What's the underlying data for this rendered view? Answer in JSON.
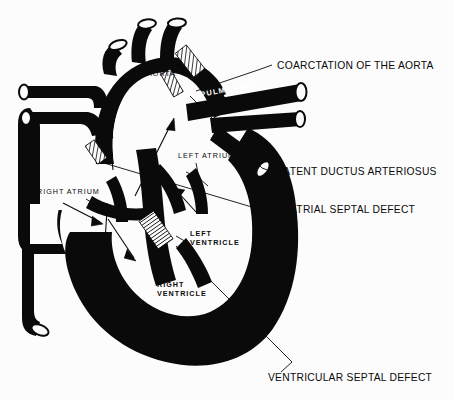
{
  "figure": {
    "background_color": "#fcfcfc",
    "ink_color": "#0a0a0a",
    "lumen_color": "#fcfcfc"
  },
  "callouts": [
    {
      "id": "coarctation",
      "label": "COARCTATION OF THE AORTA",
      "text_x": 277,
      "text_y": 69,
      "leader": "M 272 65 L 258 70 L 196 91",
      "marker": "coarctation-hatch"
    },
    {
      "id": "pda",
      "label": "PATENT DUCTUS ARTERIOSUS",
      "text_x": 277,
      "text_y": 175,
      "leader": "M 273 172 L 262 168 L 190 96",
      "marker": "pda-hatch"
    },
    {
      "id": "asd",
      "label": "ATRIAL SEPTAL DEFECT",
      "text_x": 290,
      "text_y": 213,
      "leader": "M 286 209 L 272 213 L 104 163",
      "marker": "asd-hatch"
    },
    {
      "id": "vsd",
      "label": "VENTRICULAR SEPTAL DEFECT",
      "text_x": 268,
      "text_y": 381,
      "leader": "M 281 372 L 292 362 L 176 246",
      "marker": "vsd-hatch"
    }
  ],
  "anatomy_labels": [
    {
      "id": "aorta",
      "label": "AORTA",
      "x": 147,
      "y": 76,
      "color": "#0a0a0a",
      "style": "plain"
    },
    {
      "id": "pulmonary",
      "label": "PULMONARY ARTERY",
      "x": 201,
      "y": 97,
      "color": "#ffffff",
      "style": "vessel",
      "rotation": -11
    },
    {
      "id": "left-atrium",
      "label": "LEFT ATRIUM",
      "x": 178,
      "y": 158,
      "color": "#0a0a0a",
      "style": "plain"
    },
    {
      "id": "right-atrium",
      "label": "RIGHT ATRIUM",
      "x": 37,
      "y": 194,
      "color": "#0a0a0a",
      "style": "plain"
    },
    {
      "id": "left-ventricle-l1",
      "label": "LEFT",
      "x": 190,
      "y": 236,
      "color": "#0a0a0a",
      "style": "bold"
    },
    {
      "id": "left-ventricle-l2",
      "label": "VENTRICLE",
      "x": 190,
      "y": 245,
      "color": "#0a0a0a",
      "style": "bold"
    },
    {
      "id": "right-ventricle-l1",
      "label": "RIGHT",
      "x": 157,
      "y": 287,
      "color": "#0a0a0a",
      "style": "bold"
    },
    {
      "id": "right-ventricle-l2",
      "label": "VENTRICLE",
      "x": 157,
      "y": 296,
      "color": "#0a0a0a",
      "style": "bold"
    }
  ],
  "anatomy_leaders": [
    {
      "id": "left-atrium-leader",
      "path": "M 196 163 L 199 178 M 199 178 L 186 172 M 199 178 L 208 186"
    },
    {
      "id": "right-atrium-leader",
      "path": "M 86 199 L 96 205 M 96 205 L 88 204 M 96 205 L 95 199"
    },
    {
      "id": "left-ventricle-leader",
      "path": "M 188 243 L 176 236"
    }
  ],
  "flow_arrows": [
    {
      "id": "arrow-rv-up",
      "path": "M 104 257 L 107 210",
      "head": "M 103 212 L 107 203 L 111 213"
    },
    {
      "id": "arrow-svc-down",
      "path": "M 113 170 L 109 132",
      "head": "M 105 137 L 109 128 L 113 138"
    },
    {
      "id": "arrow-ra-in",
      "path": "M 63 203 L 100 222",
      "head": "M 92 216 L 103 224 L 91 226"
    },
    {
      "id": "arrow-rv-diag",
      "path": "M 108 219 L 134 258",
      "head": "M 127 249 L 136 261 L 124 258"
    },
    {
      "id": "arrow-la-lv",
      "path": "M 135 196 L 172 122",
      "head": "M 166 130 L 174 118 L 175 131"
    },
    {
      "id": "arrow-mitral",
      "path": "M 196 212 L 176 190",
      "head": "M 179 198 L 174 188 L 185 190"
    }
  ],
  "defect_markers": [
    {
      "id": "coarctation-hatch",
      "x": 190,
      "y": 61,
      "w": 14,
      "h": 30,
      "angle": -38,
      "pattern": "diagonal"
    },
    {
      "id": "pda-hatch",
      "x": 172,
      "y": 83,
      "w": 11,
      "h": 26,
      "angle": -30,
      "pattern": "diagonal"
    },
    {
      "id": "asd-hatch",
      "x": 96,
      "y": 152,
      "w": 11,
      "h": 22,
      "angle": -35,
      "pattern": "diagonal"
    },
    {
      "id": "vsd-hatch",
      "x": 156,
      "y": 230,
      "w": 18,
      "h": 34,
      "angle": -35,
      "pattern": "horizontal"
    }
  ]
}
